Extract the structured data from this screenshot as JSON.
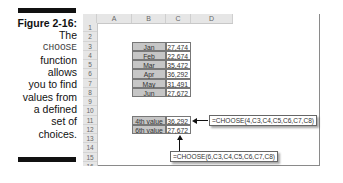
{
  "caption": {
    "figure_label": "Figure 2-16:",
    "lines": [
      "The",
      "CHOOSE",
      "function",
      "allows",
      "you to find",
      "values from",
      "a defined",
      "set of",
      "choices."
    ]
  },
  "spreadsheet": {
    "columns": [
      "",
      "A",
      "B",
      "C",
      "D"
    ],
    "rows": [
      "1",
      "2",
      "3",
      "4",
      "5",
      "6",
      "7",
      "8",
      "9",
      "10",
      "11",
      "12",
      "13",
      "14",
      "15",
      "16"
    ],
    "month_table": [
      {
        "label": "Jan",
        "value": "27,474"
      },
      {
        "label": "Feb",
        "value": "22,674"
      },
      {
        "label": "Mar",
        "value": "35,472"
      },
      {
        "label": "Apr",
        "value": "36,292"
      },
      {
        "label": "May",
        "value": "31,491"
      },
      {
        "label": "Jun",
        "value": "27,672"
      }
    ],
    "result_table": [
      {
        "label": "4th value",
        "value": "36,292"
      },
      {
        "label": "6th value",
        "value": "27,672"
      }
    ]
  },
  "callouts": {
    "formula_4th": "=CHOOSE(4,C3,C4,C5,C6,C7,C8)",
    "formula_6th": "=CHOOSE(6,C3,C4,C5,C6,C7,C8)"
  }
}
